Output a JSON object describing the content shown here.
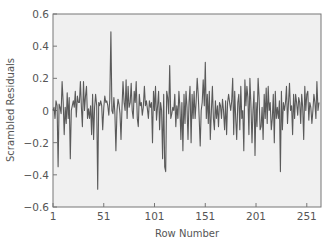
{
  "chart_data": {
    "type": "line",
    "title": "",
    "xlabel": "Row Number",
    "ylabel": "Scrambled Residuals",
    "xlim": [
      1,
      265
    ],
    "ylim": [
      -0.6,
      0.6
    ],
    "xticks": [
      1,
      51,
      101,
      151,
      201,
      251
    ],
    "yticks": [
      0.6,
      0.4,
      0.2,
      0,
      -0.2,
      -0.4,
      -0.6
    ],
    "ytick_labels": [
      "0.6",
      "0.4",
      "0.2",
      "0",
      "−0.2",
      "−0.4",
      "−0.6"
    ],
    "grid": false,
    "legend": null,
    "colors": {
      "line": "#5a5a5a",
      "plot_bg": "#f0f0f0",
      "axis": "#777777"
    },
    "series": [
      {
        "name": "Scrambled Residuals",
        "x_start": 1,
        "values": [
          0.0,
          0.02,
          -0.05,
          0.06,
          0.03,
          -0.35,
          0.04,
          0.02,
          -0.02,
          0.18,
          0.05,
          -0.15,
          0.02,
          -0.08,
          0.11,
          -0.05,
          0.08,
          -0.3,
          0.0,
          0.03,
          0.06,
          0.02,
          0.12,
          -0.04,
          0.09,
          0.05,
          0.05,
          0.18,
          0.02,
          -0.1,
          0.18,
          0.0,
          0.09,
          0.15,
          -0.05,
          0.01,
          -0.05,
          0.03,
          -0.15,
          0.1,
          -0.18,
          0.02,
          0.1,
          0.03,
          -0.49,
          0.05,
          0.03,
          0.06,
          0.03,
          -0.12,
          0.02,
          0.09,
          0.05,
          0.06,
          0.03,
          -0.03,
          0.07,
          0.49,
          0.0,
          -0.02,
          0.08,
          -0.02,
          -0.25,
          0.0,
          0.07,
          0.04,
          -0.02,
          -0.18,
          0.02,
          0.18,
          0.05,
          0.0,
          0.19,
          -0.05,
          0.15,
          0.02,
          0.05,
          0.17,
          0.0,
          -0.05,
          0.12,
          0.05,
          0.18,
          -0.05,
          -0.1,
          0.1,
          0.03,
          0.05,
          -0.03,
          0.02,
          0.15,
          0.03,
          0.06,
          0.01,
          -0.05,
          0.06,
          0.02,
          0.05,
          -0.2,
          0.12,
          0.0,
          0.15,
          -0.06,
          0.03,
          0.12,
          -0.12,
          0.05,
          0.0,
          -0.3,
          0.1,
          -0.35,
          -0.38,
          0.12,
          0.08,
          -0.02,
          0.28,
          -0.05,
          -0.02,
          0.02,
          0.0,
          0.1,
          -0.1,
          0.03,
          -0.05,
          0.12,
          0.02,
          -0.18,
          0.05,
          -0.25,
          0.1,
          -0.08,
          0.12,
          0.02,
          -0.18,
          0.05,
          0.15,
          -0.2,
          0.1,
          -0.05,
          0.12,
          -0.05,
          0.05,
          0.2,
          0.1,
          -0.05,
          -0.22,
          0.0,
          0.05,
          0.19,
          0.03,
          0.3,
          -0.05,
          0.1,
          -0.08,
          0.12,
          -0.18,
          0.0,
          0.15,
          -0.05,
          -0.12,
          0.06,
          -0.05,
          0.03,
          -0.1,
          0.05,
          0.03,
          -0.05,
          0.07,
          0.0,
          -0.12,
          0.06,
          -0.15,
          0.05,
          0.1,
          0.05,
          0.0,
          0.06,
          0.2,
          -0.15,
          0.12,
          -0.05,
          -0.18,
          0.05,
          0.1,
          -0.12,
          0.15,
          -0.05,
          0.0,
          -0.25,
          0.19,
          0.03,
          0.15,
          0.08,
          -0.15,
          0.2,
          0.02,
          -0.2,
          0.0,
          0.12,
          -0.28,
          0.05,
          -0.1,
          0.2,
          0.08,
          -0.12,
          -0.1,
          0.02,
          -0.18,
          0.1,
          -0.05,
          0.14,
          -0.08,
          0.15,
          0.0,
          0.05,
          -0.12,
          -0.05,
          0.1,
          -0.2,
          0.12,
          -0.05,
          0.02,
          -0.05,
          0.06,
          -0.38,
          0.12,
          -0.12,
          0.05,
          0.0,
          0.05,
          0.15,
          -0.08,
          0.05,
          0.17,
          0.0,
          0.03,
          -0.15,
          0.1,
          -0.05,
          0.1,
          0.05,
          -0.03,
          0.08,
          0.05,
          -0.08,
          0.1,
          0.02,
          -0.18,
          0.15,
          0.0,
          0.1,
          0.12,
          -0.06,
          0.05,
          0.02,
          -0.08,
          0.0,
          0.1,
          0.05,
          -0.05,
          0.18,
          0.0,
          0.05
        ]
      }
    ]
  },
  "axes": {
    "x_title": "Row Number",
    "y_title": "Scrambled Residuals"
  }
}
